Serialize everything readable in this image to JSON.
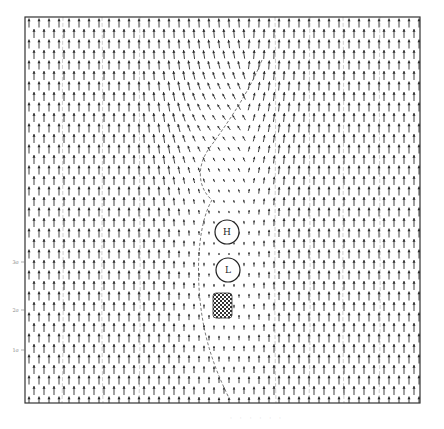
{
  "figure": {
    "type": "vector-field",
    "frame": {
      "x": 25,
      "y": 17,
      "width": 395,
      "height": 386
    },
    "colors": {
      "arrow": "#2a2a2a",
      "frame": "#333333",
      "contour": "#555555",
      "hatch": "#333333",
      "background": "#ffffff"
    },
    "grid": {
      "dx": 10,
      "dy": 10.5,
      "stagger": 5
    },
    "labels": {
      "high": "H",
      "low": "L"
    },
    "high_center": {
      "x": 227,
      "y": 232,
      "r": 12
    },
    "low_center": {
      "x": 228,
      "y": 270,
      "r": 12
    },
    "obstacle": {
      "x": 213,
      "y": 293,
      "w": 19,
      "h": 25
    },
    "calm_region": {
      "cx": 225,
      "cy": 240,
      "rx": 28,
      "ry": 95
    },
    "left_ticks": [
      {
        "y": 262,
        "label": "3σ"
      },
      {
        "y": 310,
        "label": "2σ"
      },
      {
        "y": 350,
        "label": "1σ"
      }
    ],
    "contours_x": [
      63,
      102,
      140,
      275,
      310,
      343,
      380
    ]
  },
  "caption": "· · · · · ·"
}
